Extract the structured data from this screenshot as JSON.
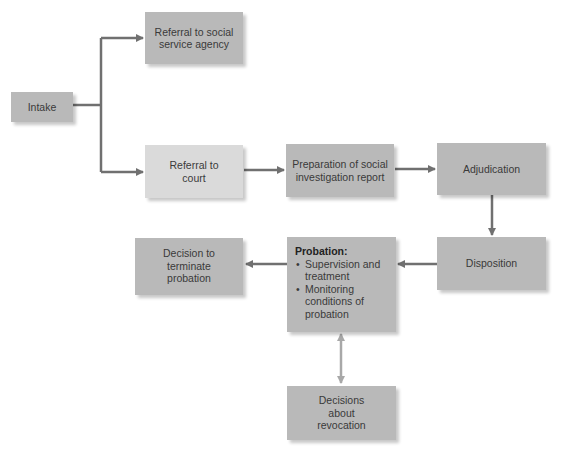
{
  "diagram": {
    "type": "flowchart",
    "colors": {
      "box": "#b9b9b9",
      "box_light": "#dadada",
      "arrow": "#707070",
      "arrow_light": "#a8a8a8"
    },
    "nodes": {
      "intake": "Intake",
      "referral_social": "Referral to social service agency",
      "referral_court": "Referral to court",
      "preparation": "Preparation of social investigation report",
      "adjudication": "Adjudication",
      "disposition": "Disposition",
      "probation": {
        "title": "Probation:",
        "items": [
          "Supervision and treatment",
          "Monitoring conditions of probation"
        ]
      },
      "terminate": "Decision to terminate probation",
      "revocation": "Decisions about revocation"
    },
    "edges": [
      {
        "from": "Intake",
        "to": "Referral to social service agency"
      },
      {
        "from": "Intake",
        "to": "Referral to court"
      },
      {
        "from": "Referral to court",
        "to": "Preparation of social investigation report"
      },
      {
        "from": "Preparation of social investigation report",
        "to": "Adjudication"
      },
      {
        "from": "Adjudication",
        "to": "Disposition"
      },
      {
        "from": "Disposition",
        "to": "Probation"
      },
      {
        "from": "Probation",
        "to": "Decision to terminate probation"
      },
      {
        "from": "Probation",
        "to": "Decisions about revocation",
        "bidirectional": true
      }
    ]
  }
}
